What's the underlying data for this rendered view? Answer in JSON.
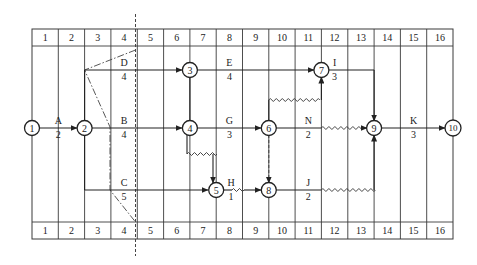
{
  "diagram": {
    "type": "time-scaled network (double-code) diagram",
    "time_scale_top": [
      "1",
      "2",
      "3",
      "4",
      "5",
      "6",
      "7",
      "8",
      "9",
      "10",
      "11",
      "12",
      "13",
      "14",
      "15",
      "16"
    ],
    "time_scale_bottom": [
      "1",
      "2",
      "3",
      "4",
      "5",
      "6",
      "7",
      "8",
      "9",
      "10",
      "11",
      "12",
      "13",
      "14",
      "15",
      "16"
    ],
    "nodes": [
      {
        "id": "1",
        "label": "1"
      },
      {
        "id": "2",
        "label": "2"
      },
      {
        "id": "3",
        "label": "3"
      },
      {
        "id": "4",
        "label": "4"
      },
      {
        "id": "5",
        "label": "5"
      },
      {
        "id": "6",
        "label": "6"
      },
      {
        "id": "7",
        "label": "7"
      },
      {
        "id": "8",
        "label": "8"
      },
      {
        "id": "9",
        "label": "9"
      },
      {
        "id": "10",
        "label": "10"
      }
    ],
    "activities": [
      {
        "name": "A",
        "duration": "2",
        "from": "1",
        "to": "2"
      },
      {
        "name": "D",
        "duration": "4",
        "from": "2",
        "to": "3"
      },
      {
        "name": "B",
        "duration": "4",
        "from": "2",
        "to": "4"
      },
      {
        "name": "C",
        "duration": "5",
        "from": "2",
        "to": "5"
      },
      {
        "name": "E",
        "duration": "4",
        "from": "3",
        "to": "7"
      },
      {
        "name": "G",
        "duration": "3",
        "from": "4",
        "to": "6"
      },
      {
        "name": "H",
        "duration": "1",
        "from": "5",
        "to": "8"
      },
      {
        "name": "I",
        "duration": "3",
        "from": "7",
        "to": "9"
      },
      {
        "name": "N",
        "duration": "2",
        "from": "6",
        "to": "9"
      },
      {
        "name": "J",
        "duration": "2",
        "from": "8",
        "to": "9"
      },
      {
        "name": "K",
        "duration": "3",
        "from": "9",
        "to": "10"
      }
    ],
    "dummy_activities": [
      {
        "from": "3",
        "to": "4"
      },
      {
        "from": "4",
        "to": "5"
      },
      {
        "from": "6",
        "to": "7"
      },
      {
        "from": "6",
        "to": "8"
      }
    ],
    "check_line": {
      "style": "dash-dot",
      "at_time": "4"
    }
  }
}
